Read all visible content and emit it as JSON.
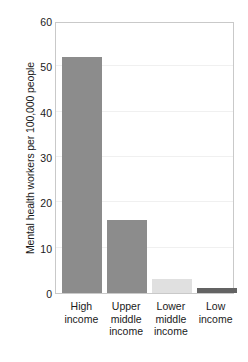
{
  "chart_data": {
    "type": "bar",
    "title": "",
    "subtitle": "",
    "xlabel": "",
    "ylabel": "Mental health workers per 100,000 people",
    "categories": [
      "High income",
      "Upper middle income",
      "Lower middle income",
      "Low income"
    ],
    "category_lines": [
      [
        "High",
        "income"
      ],
      [
        "Upper",
        "middle",
        "income"
      ],
      [
        "Lower",
        "middle",
        "income"
      ],
      [
        "Low",
        "income"
      ]
    ],
    "values": [
      52,
      16,
      3,
      1
    ],
    "bar_colors": [
      "#8c8c8c",
      "#8c8c8c",
      "#e0e0e0",
      "#636363"
    ],
    "ylim": [
      0,
      60
    ],
    "yticks": [
      60,
      50,
      40,
      30,
      20,
      10,
      0
    ],
    "ytick_labels": [
      "60",
      "50",
      "40",
      "30",
      "20",
      "10",
      "0"
    ],
    "grid": true,
    "grid_axis": "y",
    "legend": false,
    "legend_position": "none",
    "frame_color": "#c9c9c9",
    "gridline_color": "#f0f0f0",
    "background_color": "#ffffff",
    "text_color": "#1a1a1a"
  }
}
